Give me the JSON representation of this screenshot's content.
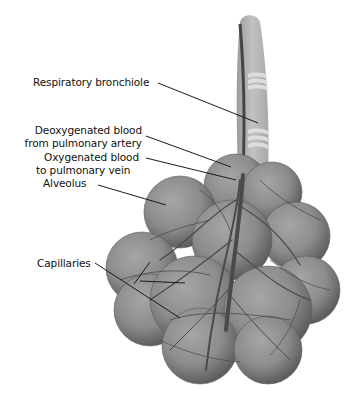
{
  "diagram": {
    "colors": {
      "background": "#ffffff",
      "alveolus_fill": "#8a8a8a",
      "alveolus_light": "#a4a4a4",
      "alveolus_dark": "#5e5e5e",
      "bronchiole": "#b3b3b3",
      "bronchiole_band": "#e0e0e0",
      "vessel": "#4a4a4a",
      "leader_line": "#1a1a1a",
      "text": "#111111"
    },
    "labels": [
      {
        "id": "respiratory-bronchiole",
        "lines": [
          "Respiratory bronchiole"
        ]
      },
      {
        "id": "deoxygenated-blood",
        "lines": [
          "Deoxygenated blood",
          "from pulmonary artery"
        ]
      },
      {
        "id": "oxygenated-blood",
        "lines": [
          "Oxygenated blood",
          "to pulmonary vein"
        ]
      },
      {
        "id": "alveolus",
        "lines": [
          "Alveolus"
        ]
      },
      {
        "id": "capillaries",
        "lines": [
          "Capillaries"
        ]
      }
    ]
  }
}
